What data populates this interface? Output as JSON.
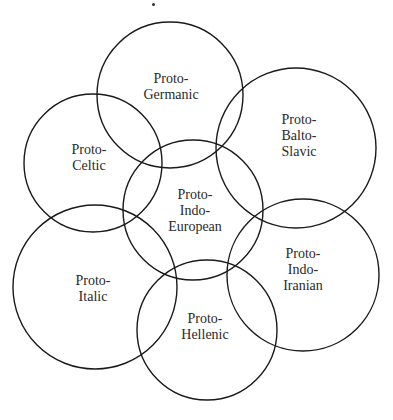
{
  "diagram": {
    "type": "overlapping-circles",
    "stroke_color": "#1a1a1a",
    "background": "#ffffff",
    "nodes": [
      {
        "id": "germanic",
        "lines": [
          "Proto-",
          "Germanic"
        ],
        "cx": 170,
        "cy": 95,
        "r": 73,
        "label_x": 171,
        "label_y": 87
      },
      {
        "id": "celtic",
        "lines": [
          "Proto-",
          "Celtic"
        ],
        "cx": 93,
        "cy": 163,
        "r": 69,
        "label_x": 89,
        "label_y": 158
      },
      {
        "id": "balto-slavic",
        "lines": [
          "Proto-",
          "Balto-",
          "Slavic"
        ],
        "cx": 296,
        "cy": 148,
        "r": 80,
        "label_x": 299,
        "label_y": 136
      },
      {
        "id": "pie",
        "lines": [
          "Proto-",
          "Indo-",
          "European"
        ],
        "cx": 193,
        "cy": 210,
        "r": 70,
        "label_x": 195,
        "label_y": 211
      },
      {
        "id": "italic",
        "lines": [
          "Proto-",
          "Italic"
        ],
        "cx": 95,
        "cy": 287,
        "r": 82,
        "label_x": 93,
        "label_y": 289
      },
      {
        "id": "indo-iranian",
        "lines": [
          "Proto-",
          "Indo-",
          "Iranian"
        ],
        "cx": 303,
        "cy": 275,
        "r": 76,
        "label_x": 303,
        "label_y": 270
      },
      {
        "id": "hellenic",
        "lines": [
          "Proto-",
          "Hellenic"
        ],
        "cx": 207,
        "cy": 330,
        "r": 70,
        "label_x": 205,
        "label_y": 327
      }
    ]
  }
}
